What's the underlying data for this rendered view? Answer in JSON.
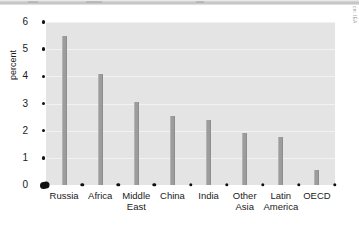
{
  "figure": {
    "source_credit": "ce: IEA",
    "colors": {
      "bar": "#9c9c9c",
      "plot_background": "#e4e4e4",
      "gridline": "#f2f2f2",
      "tick_marker": "#111111",
      "text": "#1a1a1a",
      "page_edge": "#bdbdbd"
    }
  },
  "chart_data": {
    "type": "bar",
    "title": "",
    "subtitle": "",
    "xlabel": "",
    "ylabel": "percent",
    "categories": [
      "Russia",
      "Africa",
      "Middle\nEast",
      "China",
      "India",
      "Other\nAsia",
      "Latin\nAmerica",
      "OECD"
    ],
    "values": [
      5.5,
      4.1,
      3.05,
      2.55,
      2.4,
      1.9,
      1.78,
      0.55
    ],
    "ylim": [
      0,
      6
    ],
    "yticks": [
      0,
      1,
      2,
      3,
      4,
      5,
      6
    ],
    "ytick_labels": [
      "0",
      "1",
      "2",
      "3",
      "4",
      "5",
      "6"
    ],
    "grid": true,
    "grid_axis": "y",
    "legend": null,
    "legend_position": "none",
    "annotations": []
  }
}
